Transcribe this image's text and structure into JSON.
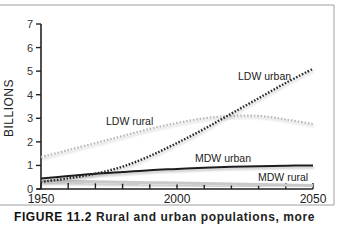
{
  "chart_data": {
    "type": "line",
    "title": "",
    "xlabel": "",
    "ylabel": "BILLIONS",
    "xlim": [
      1950,
      2050
    ],
    "ylim": [
      0,
      7
    ],
    "x_ticks_labeled": [
      1950,
      2000,
      2050
    ],
    "x_ticks": [
      1950,
      1960,
      1970,
      1980,
      1990,
      2000,
      2010,
      2020,
      2030,
      2040,
      2050
    ],
    "y_ticks": [
      0,
      1,
      2,
      3,
      4,
      5,
      6,
      7
    ],
    "grid": false,
    "legend": "inline labels",
    "x": [
      1950,
      1960,
      1970,
      1980,
      1990,
      2000,
      2010,
      2020,
      2030,
      2040,
      2050
    ],
    "series": [
      {
        "name": "LDW urban",
        "style": "dotted-dark",
        "values": [
          0.3,
          0.45,
          0.65,
          0.95,
          1.4,
          1.95,
          2.55,
          3.2,
          3.85,
          4.5,
          5.1
        ]
      },
      {
        "name": "LDW rural",
        "style": "dotted-light",
        "values": [
          1.35,
          1.65,
          1.95,
          2.25,
          2.55,
          2.8,
          3.0,
          3.1,
          3.1,
          2.95,
          2.75
        ]
      },
      {
        "name": "MDW urban",
        "style": "solid-dark",
        "values": [
          0.45,
          0.55,
          0.65,
          0.72,
          0.8,
          0.85,
          0.9,
          0.94,
          0.97,
          0.99,
          1.0
        ]
      },
      {
        "name": "MDW rural",
        "style": "solid-light",
        "values": [
          0.35,
          0.33,
          0.31,
          0.29,
          0.27,
          0.25,
          0.23,
          0.21,
          0.19,
          0.17,
          0.15
        ]
      }
    ],
    "annotations": [
      "LDW urban",
      "LDW rural",
      "MDW urban",
      "MDW rural"
    ]
  },
  "caption": {
    "figure": "FIGURE 11.2",
    "text": "Rural and urban populations, more"
  },
  "colors": {
    "ldw_urban": "#2b2b2b",
    "ldw_rural": "#b8b8b8",
    "mdw_urban": "#1e1e1e",
    "mdw_rural": "#c9c9c9",
    "frame": "#9a9a9a"
  }
}
